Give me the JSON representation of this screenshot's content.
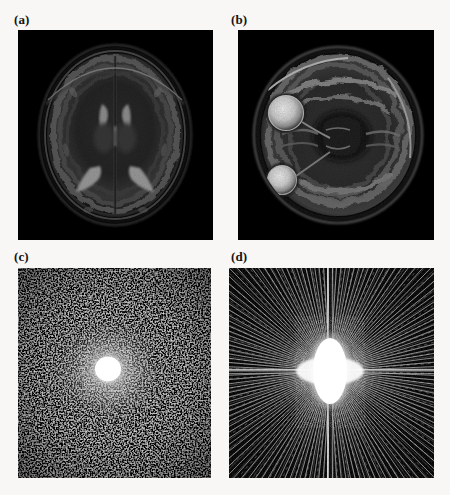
{
  "figure": {
    "background_color": "#f8f7f5",
    "panel_background_color": "#000000",
    "rows": 2,
    "columns": 2,
    "panels": [
      {
        "id": "a",
        "label": "(a)",
        "content_type": "mri-brain-axial-slice",
        "description": "Axial T2-weighted brain MRI at the level of the lateral ventricles",
        "anatomy_visible": [
          "skull",
          "scalp",
          "cerebral cortex",
          "lateral ventricles",
          "thalamus",
          "white matter"
        ],
        "brightness": "dark",
        "image_position": {
          "x": 18,
          "y": 30,
          "width": 195,
          "height": 210
        }
      },
      {
        "id": "b",
        "label": "(b)",
        "content_type": "mri-brain-axial-slice",
        "description": "Axial T2-weighted brain MRI at the level of the orbits showing both eyeballs",
        "anatomy_visible": [
          "orbits",
          "eyeballs",
          "temporal lobes",
          "cerebellum",
          "skull base",
          "sinuses"
        ],
        "brightness": "bright",
        "image_position": {
          "x": 238,
          "y": 30,
          "width": 196,
          "height": 210
        }
      },
      {
        "id": "c",
        "label": "(c)",
        "content_type": "k-space-magnitude-spectrum",
        "description": "Fourier magnitude spectrum with dense random speckle noise and a bright saturated centre (DC component)",
        "pattern": "random-speckle",
        "center_hotspot": true,
        "image_position": {
          "x": 18,
          "y": 268,
          "width": 193,
          "height": 210
        }
      },
      {
        "id": "d",
        "label": "(d)",
        "content_type": "k-space-magnitude-spectrum",
        "description": "Fourier magnitude spectrum showing radial streak artifacts converging on a bright elongated centre",
        "pattern": "radial-streaks",
        "center_hotspot": true,
        "image_position": {
          "x": 229,
          "y": 268,
          "width": 205,
          "height": 210
        }
      }
    ]
  }
}
